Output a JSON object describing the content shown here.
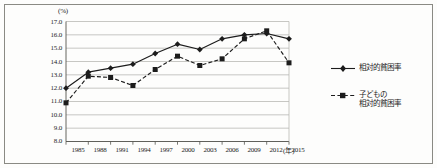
{
  "chart_data": {
    "type": "line",
    "title": "",
    "xlabel": "(年)",
    "ylabel": "(%)",
    "x": [
      1985,
      1988,
      1991,
      1994,
      1997,
      2000,
      2003,
      2006,
      2009,
      2012,
      2015
    ],
    "categories": [
      "1985",
      "1988",
      "1991",
      "1994",
      "1997",
      "2000",
      "2003",
      "2006",
      "2009",
      "2012",
      "2015"
    ],
    "ylim": [
      8.0,
      17.0
    ],
    "y_ticks": [
      "8.0",
      "9.0",
      "10.0",
      "11.0",
      "12.0",
      "13.0",
      "14.0",
      "15.0",
      "16.0",
      "17.0"
    ],
    "y_tick_values": [
      8.0,
      9.0,
      10.0,
      11.0,
      12.0,
      13.0,
      14.0,
      15.0,
      16.0,
      17.0
    ],
    "grid": true,
    "grid_axis": "y",
    "legend_position": "right",
    "series": [
      {
        "name": "相対的貧困率",
        "marker": "diamond",
        "linestyle": "solid",
        "color": "#1c1c1c",
        "values": [
          12.0,
          13.2,
          13.5,
          13.8,
          14.6,
          15.3,
          14.9,
          15.7,
          16.0,
          16.1,
          15.7
        ]
      },
      {
        "name": "子どもの\n相対的貧困率",
        "name_line1": "子どもの",
        "name_line2": "相対的貧困率",
        "marker": "square",
        "linestyle": "dashed",
        "color": "#1c1c1c",
        "values": [
          10.9,
          12.9,
          12.8,
          12.2,
          13.4,
          14.4,
          13.7,
          14.2,
          15.7,
          16.3,
          13.9
        ]
      }
    ]
  },
  "axes": {
    "y_unit_label": "(%)",
    "x_unit_label": "(年)"
  },
  "legend": {
    "entry1": "相対的貧困率",
    "entry2_line1": "子どもの",
    "entry2_line2": "相対的貧困率"
  }
}
